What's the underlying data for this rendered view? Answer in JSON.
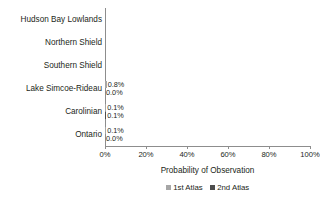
{
  "chart_data": {
    "type": "bar",
    "orientation": "horizontal",
    "title": "",
    "xlabel": "Probability of Observation",
    "ylabel": "",
    "xlim": [
      0,
      100
    ],
    "xticks": [
      "0%",
      "20%",
      "40%",
      "60%",
      "80%",
      "100%"
    ],
    "xtick_values": [
      0,
      20,
      40,
      60,
      80,
      100
    ],
    "grid": false,
    "legend_position": "bottom",
    "categories": [
      "Hudson Bay Lowlands",
      "Northern Shield",
      "Southern Shield",
      "Lake Simcoe-Rideau",
      "Carolinian",
      "Ontario"
    ],
    "series": [
      {
        "name": "1st Atlas",
        "color": "#a6a6a6",
        "values": [
          0.0,
          0.0,
          0.0,
          0.8,
          0.1,
          0.1
        ],
        "labels": [
          "",
          "",
          "",
          "0.8%",
          "0.1%",
          "0.1%"
        ]
      },
      {
        "name": "2nd Atlas",
        "color": "#4d4d4d",
        "values": [
          0.0,
          0.0,
          0.0,
          0.0,
          0.1,
          0.0
        ],
        "labels": [
          "",
          "",
          "",
          "0.0%",
          "0.1%",
          "0.0%"
        ]
      }
    ]
  },
  "axis": {
    "x_title": "Probability of Observation",
    "ticks": [
      {
        "label": "0%",
        "value": 0
      },
      {
        "label": "20%",
        "value": 20
      },
      {
        "label": "40%",
        "value": 40
      },
      {
        "label": "60%",
        "value": 60
      },
      {
        "label": "80%",
        "value": 80
      },
      {
        "label": "100%",
        "value": 100
      }
    ]
  },
  "rows": [
    {
      "category": "Hudson Bay Lowlands",
      "v1": 0.0,
      "v2": 0.0,
      "l1": "",
      "l2": ""
    },
    {
      "category": "Northern Shield",
      "v1": 0.0,
      "v2": 0.0,
      "l1": "",
      "l2": ""
    },
    {
      "category": "Southern Shield",
      "v1": 0.0,
      "v2": 0.0,
      "l1": "",
      "l2": ""
    },
    {
      "category": "Lake Simcoe-Rideau",
      "v1": 0.8,
      "v2": 0.0,
      "l1": "0.8%",
      "l2": "0.0%"
    },
    {
      "category": "Carolinian",
      "v1": 0.1,
      "v2": 0.1,
      "l1": "0.1%",
      "l2": "0.1%"
    },
    {
      "category": "Ontario",
      "v1": 0.1,
      "v2": 0.0,
      "l1": "0.1%",
      "l2": "0.0%"
    }
  ],
  "legend": [
    {
      "label": "1st Atlas",
      "color": "#a6a6a6"
    },
    {
      "label": "2nd Atlas",
      "color": "#4d4d4d"
    }
  ]
}
